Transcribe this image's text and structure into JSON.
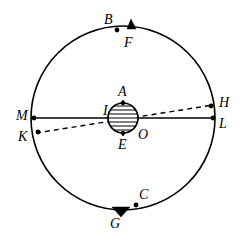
{
  "figure": {
    "kind": "geometric-astronomical-diagram",
    "background_color": "#ffffff",
    "stroke_color": "#000000"
  },
  "geometry": {
    "circle": {
      "cx": 123,
      "cy": 118,
      "r": 92,
      "stroke_width": 1.6
    },
    "globe": {
      "cx": 123,
      "cy": 118,
      "r": 15,
      "stroke_width": 1.6,
      "hatch_lines": 7,
      "hatch_spacing": 4
    },
    "solid_diameter": {
      "x1": 31,
      "y1": 118,
      "x2": 215,
      "y2": 118,
      "stroke_width": 1.6
    },
    "dashed_chord": {
      "x1": 36,
      "y1": 133,
      "x2": 213,
      "y2": 105,
      "stroke_width": 1.4,
      "dash": "5,4"
    },
    "vertical_axis": {
      "x1": 123,
      "y1": 100,
      "x2": 123,
      "y2": 136,
      "stroke_width": 1.6
    },
    "top_triangle": {
      "points": "127,29 136,29 131,19",
      "fill": "#000000"
    },
    "bottom_triangle": {
      "points": "112,207 130,207 121,217",
      "fill": "#000000"
    }
  },
  "points": [
    {
      "id": "B",
      "name": "point-b",
      "dot": {
        "x": 117,
        "y": 30
      },
      "dot_r": 2.4,
      "label": "B",
      "label_x": 104,
      "label_y": 13
    },
    {
      "id": "F",
      "name": "point-f",
      "dot": null,
      "dot_r": 0,
      "label": "F",
      "label_x": 124,
      "label_y": 36
    },
    {
      "id": "C",
      "name": "point-c",
      "dot": {
        "x": 136,
        "y": 205
      },
      "dot_r": 2.4,
      "label": "C",
      "label_x": 139,
      "label_y": 188
    },
    {
      "id": "G",
      "name": "point-g",
      "dot": null,
      "dot_r": 0,
      "label": "G",
      "label_x": 110,
      "label_y": 217
    },
    {
      "id": "M",
      "name": "point-m",
      "dot": {
        "x": 34,
        "y": 118
      },
      "dot_r": 2.4,
      "label": "M",
      "label_x": 16,
      "label_y": 109
    },
    {
      "id": "K",
      "name": "point-k",
      "dot": {
        "x": 38,
        "y": 132
      },
      "dot_r": 2.4,
      "label": "K",
      "label_x": 18,
      "label_y": 130
    },
    {
      "id": "H",
      "name": "point-h",
      "dot": {
        "x": 211,
        "y": 106
      },
      "dot_r": 2.4,
      "label": "H",
      "label_x": 219,
      "label_y": 96
    },
    {
      "id": "L",
      "name": "point-l",
      "dot": {
        "x": 213,
        "y": 118
      },
      "dot_r": 2.4,
      "label": "L",
      "label_x": 219,
      "label_y": 117
    },
    {
      "id": "A",
      "name": "point-a",
      "dot": {
        "x": 123,
        "y": 103
      },
      "dot_r": 2.2,
      "label": "A",
      "label_x": 118,
      "label_y": 85
    },
    {
      "id": "E",
      "name": "point-e",
      "dot": {
        "x": 123,
        "y": 133
      },
      "dot_r": 2.2,
      "label": "E",
      "label_x": 118,
      "label_y": 138
    },
    {
      "id": "I",
      "name": "point-i",
      "dot": null,
      "dot_r": 0,
      "label": "I",
      "label_x": 103,
      "label_y": 104
    },
    {
      "id": "O",
      "name": "point-o",
      "dot": null,
      "dot_r": 0,
      "label": "O",
      "label_x": 138,
      "label_y": 128
    }
  ]
}
